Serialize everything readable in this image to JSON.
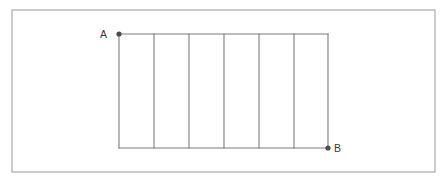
{
  "figure": {
    "canvas": {
      "width": 447,
      "height": 183,
      "background": "#ffffff"
    },
    "frame": {
      "name": "outer-border",
      "x": 12,
      "y": 10,
      "width": 423,
      "height": 162,
      "stroke": "#aaaaaa",
      "fill": "#ffffff"
    },
    "style": {
      "line_color": "#7d7d7d",
      "line_width": 1.1,
      "dot_color": "#4d4d4d",
      "dot_radius": 2.6,
      "label_color": "#3a3a3a",
      "label_font_size": 10.5
    },
    "geometry": {
      "top_y": 34,
      "bottom_y": 148,
      "left_x": 119,
      "right_x": 328,
      "vertical_x": [
        119,
        154,
        189,
        224,
        259,
        294,
        328
      ],
      "segment_count": 6,
      "segment_width": 34.8,
      "height": 114
    },
    "points": [
      {
        "id": "A",
        "label": "A",
        "x": 119,
        "y": 34,
        "label_x": 107,
        "label_y": 38,
        "label_anchor": "end"
      },
      {
        "id": "B",
        "label": "B",
        "x": 328,
        "y": 148,
        "label_x": 334,
        "label_y": 152,
        "label_anchor": "start"
      }
    ],
    "horizontal_lines": [
      {
        "name": "top-rail",
        "x1": 119,
        "y1": 34,
        "x2": 328,
        "y2": 34
      },
      {
        "name": "bottom-rail",
        "x1": 119,
        "y1": 148,
        "x2": 328,
        "y2": 148
      }
    ]
  }
}
